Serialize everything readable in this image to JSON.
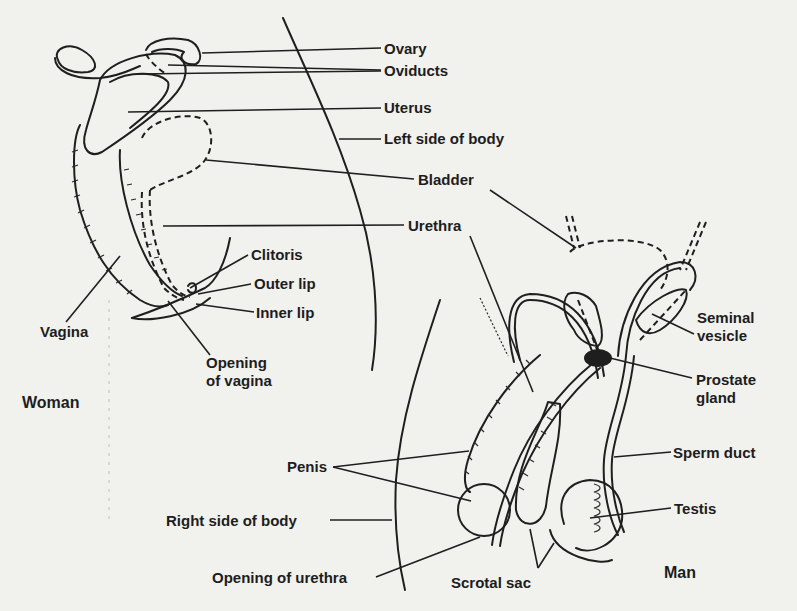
{
  "diagram": {
    "groups": [
      {
        "id": "woman",
        "label": "Woman",
        "x": 22,
        "y": 410
      },
      {
        "id": "man",
        "label": "Man",
        "x": 664,
        "y": 580
      }
    ],
    "labels": {
      "ovary": {
        "text": "Ovary",
        "x": 384,
        "y": 54,
        "line": [
          [
            202,
            53
          ],
          [
            381,
            48
          ]
        ]
      },
      "oviducts": {
        "text": "Oviducts",
        "x": 384,
        "y": 76,
        "line": [
          [
            170,
            64
          ],
          [
            381,
            70
          ],
          [
            138,
            74
          ],
          [
            381,
            71
          ]
        ]
      },
      "uterus": {
        "text": "Uterus",
        "x": 384,
        "y": 113,
        "line": [
          [
            128,
            112
          ],
          [
            381,
            108
          ]
        ]
      },
      "left_side_of_body": {
        "text": "Left side of body",
        "x": 384,
        "y": 142,
        "line": [
          [
            339,
            139
          ],
          [
            381,
            139
          ]
        ]
      },
      "bladder": {
        "text": "Bladder",
        "x": 418,
        "y": 184,
        "line": [
          [
            206,
            160
          ],
          [
            414,
            179
          ],
          [
            490,
            190
          ],
          [
            578,
            248
          ]
        ]
      },
      "urethra": {
        "text": "Urethra",
        "x": 410,
        "y": 231,
        "line": [
          [
            163,
            226
          ],
          [
            404,
            225
          ],
          [
            470,
            236
          ],
          [
            533,
            392
          ]
        ]
      },
      "clitoris": {
        "text": "Clitoris",
        "x": 251,
        "y": 259,
        "line": [
          [
            190,
            288
          ],
          [
            248,
            255
          ]
        ]
      },
      "outer_lip": {
        "text": "Outer lip",
        "x": 253,
        "y": 288,
        "line": [
          [
            198,
            294
          ],
          [
            251,
            284
          ]
        ]
      },
      "inner_lip": {
        "text": "Inner lip",
        "x": 255,
        "y": 317,
        "line": [
          [
            196,
            304
          ],
          [
            254,
            312
          ]
        ]
      },
      "vagina": {
        "text": "Vagina",
        "x": 40,
        "y": 337,
        "line": [
          [
            66,
            320
          ],
          [
            120,
            256
          ]
        ]
      },
      "opening_of_vagina": {
        "text": "Opening\nof vagina",
        "x": 206,
        "y": 368,
        "lines": [
          "Opening",
          "of vagina"
        ],
        "line": [
          [
            168,
            301
          ],
          [
            210,
            355
          ]
        ]
      },
      "seminal_vesicle": {
        "text": "Seminal\nvesicle",
        "x": 697,
        "y": 323,
        "lines": [
          "Seminal",
          "vesicle"
        ],
        "line": [
          [
            652,
            314
          ],
          [
            694,
            334
          ]
        ]
      },
      "prostate_gland": {
        "text": "Prostate\ngland",
        "x": 695,
        "y": 386,
        "lines": [
          "Prostate",
          "gland"
        ],
        "line": [
          [
            610,
            358
          ],
          [
            692,
            378
          ]
        ]
      },
      "sperm_duct": {
        "text": "Sperm duct",
        "x": 673,
        "y": 459,
        "line": [
          [
            614,
            457
          ],
          [
            671,
            452
          ]
        ]
      },
      "penis": {
        "text": "Penis",
        "x": 287,
        "y": 476,
        "line": [
          [
            333,
            467
          ],
          [
            469,
            451
          ],
          [
            333,
            467
          ],
          [
            471,
            501
          ]
        ]
      },
      "testis": {
        "text": "Testis",
        "x": 674,
        "y": 513,
        "line": [
          [
            590,
            518
          ],
          [
            671,
            508
          ]
        ]
      },
      "right_side_of_body": {
        "text": "Right side of body",
        "x": 166,
        "y": 527,
        "line": [
          [
            330,
            520
          ],
          [
            392,
            520
          ]
        ]
      },
      "opening_of_urethra": {
        "text": "Opening of urethra",
        "x": 212,
        "y": 584,
        "line": [
          [
            376,
            577
          ],
          [
            480,
            537
          ]
        ]
      },
      "scrotal_sac": {
        "text": "Scrotal sac",
        "x": 451,
        "y": 589,
        "line": [
          [
            530,
            529
          ],
          [
            538,
            568
          ],
          [
            554,
            543
          ]
        ]
      }
    }
  }
}
